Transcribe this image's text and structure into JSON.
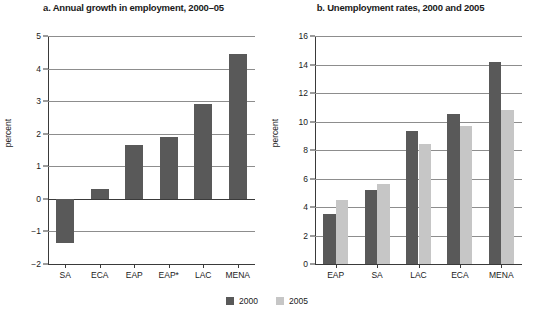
{
  "legend": {
    "position": "bottom-center",
    "entries": [
      {
        "label": "2000",
        "color": "#595959"
      },
      {
        "label": "2005",
        "color": "#c6c6c6"
      }
    ]
  },
  "colors": {
    "series_2000": "#595959",
    "series_2005": "#c6c6c6",
    "gridline": "#8d8d8d",
    "axis": "#3a3a3a",
    "background": "#ffffff"
  },
  "chart_data": [
    {
      "type": "bar",
      "panel": "a",
      "title": "a. Annual growth in employment, 2000–05",
      "xlabel": "",
      "ylabel": "percent",
      "ylim": [
        -2,
        5
      ],
      "yticks": [
        -2,
        -1,
        0,
        1,
        2,
        3,
        4,
        5
      ],
      "ytick_labels": [
        "−2",
        "−1",
        "0",
        "1",
        "2",
        "3",
        "4",
        "5"
      ],
      "grid": true,
      "categories": [
        "SA",
        "ECA",
        "EAP",
        "EAP*",
        "LAC",
        "MENA"
      ],
      "values": [
        -1.35,
        0.3,
        1.65,
        1.9,
        2.9,
        4.45
      ],
      "series": [
        {
          "name": "2000-05 annual growth",
          "color": "#595959",
          "values": [
            -1.35,
            0.3,
            1.65,
            1.9,
            2.9,
            4.45
          ]
        }
      ]
    },
    {
      "type": "bar",
      "panel": "b",
      "title": "b. Unemployment rates, 2000 and 2005",
      "xlabel": "",
      "ylabel": "percent",
      "ylim": [
        0,
        16
      ],
      "yticks": [
        0,
        2,
        4,
        6,
        8,
        10,
        12,
        14,
        16
      ],
      "ytick_labels": [
        "0",
        "2",
        "4",
        "6",
        "8",
        "10",
        "12",
        "14",
        "16"
      ],
      "grid": true,
      "categories": [
        "EAP",
        "SA",
        "LAC",
        "ECA",
        "MENA"
      ],
      "series": [
        {
          "name": "2000",
          "color": "#595959",
          "values": [
            3.5,
            5.2,
            9.3,
            10.5,
            14.2
          ]
        },
        {
          "name": "2005",
          "color": "#c6c6c6",
          "values": [
            4.5,
            5.6,
            8.4,
            9.7,
            10.8
          ]
        }
      ]
    }
  ]
}
